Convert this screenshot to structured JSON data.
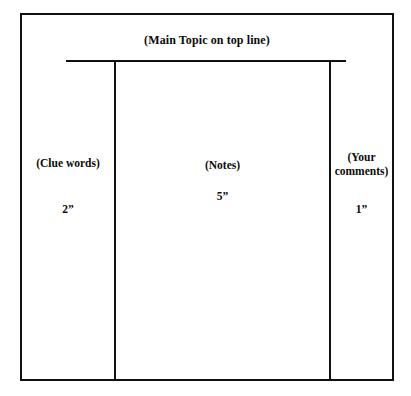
{
  "figure": {
    "type": "cornell-note-template-diagram",
    "background_color": "#ffffff",
    "ink_color": "#111111"
  },
  "header": {
    "main_topic_label": "(Main Topic on top line)"
  },
  "columns": [
    {
      "id": "clue-words",
      "label": "(Clue words)",
      "measure": "2”"
    },
    {
      "id": "notes",
      "label": "(Notes)",
      "measure": "5”"
    },
    {
      "id": "your-comments",
      "label_line_1": "(Your",
      "label_line_2": "comments)",
      "measure": "1”"
    }
  ]
}
